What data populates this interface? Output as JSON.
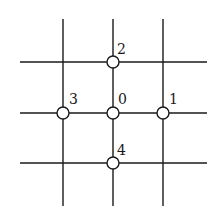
{
  "diagram": {
    "vertical_lines_x": [
      63,
      113,
      163
    ],
    "horizontal_lines_y": [
      62,
      113,
      163
    ],
    "line_extent": {
      "x_min": 20,
      "x_max": 207,
      "y_min": 19,
      "y_max": 206
    },
    "line_color": "#1a1a1a",
    "nodes": [
      {
        "id": "0",
        "label": "0",
        "cx": 113,
        "cy": 113,
        "label_x": 118,
        "label_y": 104
      },
      {
        "id": "1",
        "label": "1",
        "cx": 163,
        "cy": 113,
        "label_x": 169,
        "label_y": 104
      },
      {
        "id": "2",
        "label": "2",
        "cx": 113,
        "cy": 62,
        "label_x": 117,
        "label_y": 54
      },
      {
        "id": "3",
        "label": "3",
        "cx": 63,
        "cy": 113,
        "label_x": 69,
        "label_y": 104
      },
      {
        "id": "4",
        "label": "4",
        "cx": 113,
        "cy": 163,
        "label_x": 117,
        "label_y": 155
      }
    ],
    "node_radius": 6
  }
}
